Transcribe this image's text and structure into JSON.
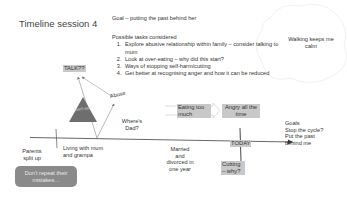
{
  "title": "Timeline session 4",
  "goal": "Goal – putting the past behind her",
  "tasks": {
    "heading": "Possible tasks considered",
    "items": [
      "Explore abusive relationship within family – consider talking to mum",
      "Look at over-eating – why did this start?",
      "Ways of stopping self-harm/cutting",
      "Get better at recognising anger and how it can be reduced"
    ]
  },
  "cloud_note": "Walking keeps me calm",
  "labels": {
    "talk": "TALK??",
    "abuse": "Abuse",
    "dont_ask": "Don't ask!",
    "wheres_dad": "Where's Dad?",
    "eating": "Eating too much",
    "angry": "Angry all the time",
    "today": "TODAY",
    "cutting": "Cutting – why?",
    "parents": "Parents split up",
    "living": "Living with mum and grampa",
    "married": "Married and divorced in one year",
    "goals": [
      "Goals",
      "Stop the cycle?",
      "Put the past behind me"
    ],
    "repeat": "Don't repeat their mistakes…"
  },
  "colors": {
    "tag_bg": "#c8c8c8",
    "triangle": "#6e6e6e",
    "repeat_bg": "#8a8a8a",
    "line": "#555555"
  }
}
